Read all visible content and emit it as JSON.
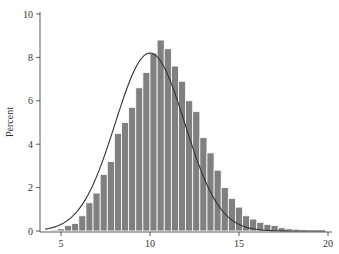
{
  "chart_data": {
    "type": "bar",
    "subtype": "histogram-with-normal-curve",
    "title": "",
    "xlabel": "",
    "ylabel": "Percent",
    "xlim": [
      4.0,
      20.0
    ],
    "ylim": [
      0,
      10
    ],
    "x_ticks": [
      5,
      10,
      15,
      20
    ],
    "y_ticks": [
      0,
      2,
      4,
      6,
      8,
      10
    ],
    "grid": false,
    "legend": null,
    "bin_width": 0.4,
    "bin_start": 4.4,
    "values": [
      0.05,
      0.1,
      0.25,
      0.35,
      0.7,
      1.3,
      1.75,
      2.6,
      3.2,
      4.5,
      5.0,
      5.7,
      6.6,
      7.3,
      8.2,
      8.8,
      8.4,
      7.6,
      6.9,
      6.0,
      5.5,
      4.3,
      3.6,
      2.8,
      2.0,
      1.5,
      1.1,
      0.7,
      0.55,
      0.4,
      0.3,
      0.25,
      0.15,
      0.1,
      0.08,
      0.05,
      0.03,
      0.02
    ],
    "normal_curve": {
      "mean": 10.0,
      "sd": 1.95,
      "peak_percent": 8.2
    },
    "colors": {
      "bar": "#808080",
      "bar_edge": "#ffffff",
      "curve": "#333333",
      "axis": "#333333"
    }
  }
}
